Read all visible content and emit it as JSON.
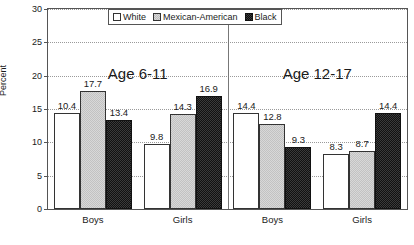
{
  "chart_data": {
    "type": "bar",
    "title": "",
    "subtitle": "",
    "xlabel": "",
    "ylabel": "Percent",
    "ylim": [
      0,
      30
    ],
    "yticks": [
      0,
      5,
      10,
      15,
      20,
      25,
      30
    ],
    "ytick_labels": [
      "0",
      "5",
      "10",
      "15",
      "20",
      "25",
      "30"
    ],
    "grid": true,
    "grid_axis": "y",
    "grid_style": "dotted",
    "legend_position": "top-center-inside",
    "categories": [
      "Boys",
      "Girls",
      "Boys",
      "Girls"
    ],
    "group_headings": [
      "Age 6-11",
      "Age 12-17"
    ],
    "groups": [
      {
        "heading": "Age 6-11",
        "categories": [
          {
            "label": "Boys",
            "bars": [
              {
                "series": "White",
                "value": 14.4,
                "value_label": "10.4"
              },
              {
                "series": "Mexican-American",
                "value": 17.7,
                "value_label": "17.7"
              },
              {
                "series": "Black",
                "value": 13.4,
                "value_label": "13.4"
              }
            ]
          },
          {
            "label": "Girls",
            "bars": [
              {
                "series": "White",
                "value": 9.8,
                "value_label": "9.8"
              },
              {
                "series": "Mexican-American",
                "value": 14.3,
                "value_label": "14.3"
              },
              {
                "series": "Black",
                "value": 16.9,
                "value_label": "16.9"
              }
            ]
          }
        ]
      },
      {
        "heading": "Age 12-17",
        "categories": [
          {
            "label": "Boys",
            "bars": [
              {
                "series": "White",
                "value": 14.4,
                "value_label": "14.4"
              },
              {
                "series": "Mexican-American",
                "value": 12.8,
                "value_label": "12.8"
              },
              {
                "series": "Black",
                "value": 9.3,
                "value_label": "9.3"
              }
            ]
          },
          {
            "label": "Girls",
            "bars": [
              {
                "series": "White",
                "value": 8.3,
                "value_label": "8.3"
              },
              {
                "series": "Mexican-American",
                "value": 8.7,
                "value_label": "8.7"
              },
              {
                "series": "Black",
                "value": 14.4,
                "value_label": "14.4"
              }
            ]
          }
        ]
      }
    ],
    "series": [
      {
        "name": "White",
        "values": [
          10.4,
          9.8,
          14.4,
          8.3
        ],
        "color": "#ffffff",
        "pattern": "solid"
      },
      {
        "name": "Mexican-American",
        "values": [
          17.7,
          14.3,
          12.8,
          8.7
        ],
        "color": "#d8d8d8",
        "pattern": "dotted"
      },
      {
        "name": "Black",
        "values": [
          13.4,
          16.9,
          9.3,
          14.4
        ],
        "color": "#3a3a3a",
        "pattern": "checker"
      }
    ],
    "legend": [
      {
        "label": "White",
        "swatch": "series-white"
      },
      {
        "label": "Mexican-American",
        "swatch": "series-mexam"
      },
      {
        "label": "Black",
        "swatch": "series-black"
      }
    ]
  }
}
